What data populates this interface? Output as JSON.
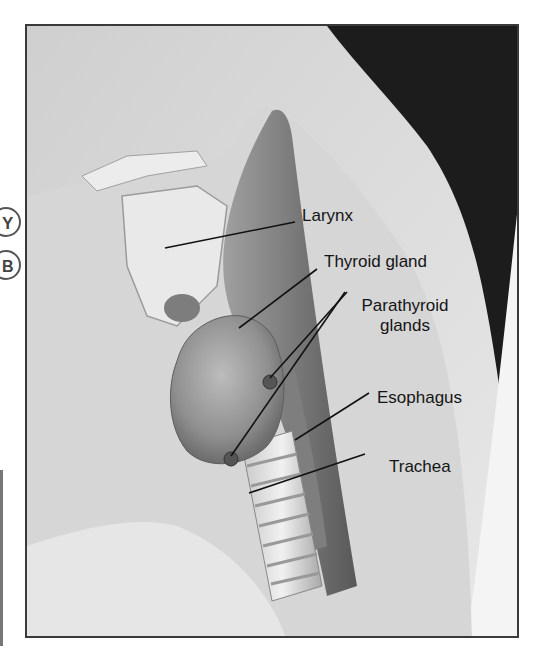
{
  "figure": {
    "labels": [
      {
        "id": "larynx",
        "text": "Larynx"
      },
      {
        "id": "thyroid",
        "text": "Thyroid gland"
      },
      {
        "id": "parathyroid",
        "text": "Parathyroid glands",
        "line1": "Parathyroid",
        "line2": "glands"
      },
      {
        "id": "esophagus",
        "text": "Esophagus"
      },
      {
        "id": "trachea",
        "text": "Trachea"
      }
    ],
    "edge_marks": [
      "Y",
      "B"
    ]
  },
  "colors": {
    "frame_border": "#3a3a3a",
    "label_text": "#151515",
    "leader_line": "#111111",
    "skin_light": "#e2e2e2",
    "skin_mid": "#c9c9c9",
    "hair": "#1c1c1c",
    "thyroid": "#8a8a8a",
    "muscle": "#6e6e6e"
  }
}
